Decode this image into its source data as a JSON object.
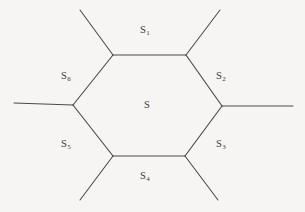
{
  "figure": {
    "kind": "hexagonal-cell-diagram",
    "background_color": "#f6f5f3",
    "line_color": "#4a4a4a",
    "text_color": "#3c3c3c",
    "center_label": {
      "base": "S",
      "subscript": ""
    },
    "edge_labels": [
      {
        "id": "s1",
        "base": "S",
        "subscript": "1",
        "position": "top"
      },
      {
        "id": "s2",
        "base": "S",
        "subscript": "2",
        "position": "upper-right"
      },
      {
        "id": "s3",
        "base": "S",
        "subscript": "3",
        "position": "lower-right"
      },
      {
        "id": "s4",
        "base": "S",
        "subscript": "4",
        "position": "bottom"
      },
      {
        "id": "s5",
        "base": "S",
        "subscript": "5",
        "position": "lower-left"
      },
      {
        "id": "s6",
        "base": "S",
        "subscript": "6",
        "position": "upper-left"
      }
    ],
    "hexagon_vertices": [
      {
        "name": "top-left",
        "x": 113,
        "y": 55
      },
      {
        "name": "top-right",
        "x": 186,
        "y": 55
      },
      {
        "name": "right",
        "x": 222,
        "y": 106
      },
      {
        "name": "bottom-right",
        "x": 185,
        "y": 156
      },
      {
        "name": "bottom-left",
        "x": 113,
        "y": 156
      },
      {
        "name": "left",
        "x": 73,
        "y": 105
      }
    ],
    "rays": [
      {
        "name": "ray-up-left",
        "from_vertex": "top-left",
        "x1": 113,
        "y1": 55,
        "x2": 80,
        "y2": 10
      },
      {
        "name": "ray-up-right",
        "from_vertex": "top-right",
        "x1": 186,
        "y1": 55,
        "x2": 220,
        "y2": 10
      },
      {
        "name": "ray-right",
        "from_vertex": "right",
        "x1": 222,
        "y1": 106,
        "x2": 293,
        "y2": 106
      },
      {
        "name": "ray-down-right",
        "from_vertex": "bottom-right",
        "x1": 185,
        "y1": 156,
        "x2": 218,
        "y2": 200
      },
      {
        "name": "ray-down-left",
        "from_vertex": "bottom-left",
        "x1": 113,
        "y1": 156,
        "x2": 80,
        "y2": 200
      },
      {
        "name": "ray-left",
        "from_vertex": "left",
        "x1": 73,
        "y1": 105,
        "x2": 14,
        "y2": 103
      }
    ]
  }
}
